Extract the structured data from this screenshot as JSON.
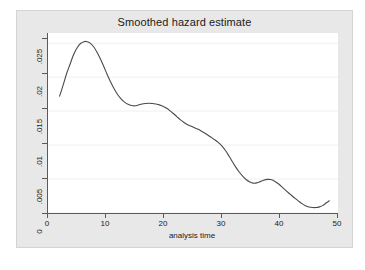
{
  "chart_data": {
    "type": "line",
    "title": "Smoothed hazard estimate",
    "xlabel": "analysis time",
    "ylabel": "",
    "xlim": [
      0,
      50
    ],
    "ylim": [
      0,
      0.0265
    ],
    "grid": "horizontal",
    "legend": "none",
    "xticks": [
      "0",
      "10",
      "20",
      "30",
      "40",
      "50"
    ],
    "xtick_values": [
      0,
      10,
      20,
      30,
      40,
      50
    ],
    "yticks": [
      "0",
      ".005",
      ".01",
      ".015",
      ".02",
      ".025"
    ],
    "ytick_values": [
      0,
      0.005,
      0.01,
      0.015,
      0.02,
      0.025
    ],
    "line_color": "#4a4a4a",
    "series": [
      {
        "name": "smoothed hazard",
        "x": [
          2.0,
          2.6,
          3.2,
          3.8,
          4.4,
          5.0,
          5.6,
          6.2,
          6.6,
          7.2,
          7.8,
          8.4,
          9.0,
          9.6,
          10.2,
          10.8,
          11.4,
          12.0,
          12.6,
          13.2,
          13.8,
          14.4,
          15.0,
          15.6,
          16.2,
          16.8,
          17.4,
          18.0,
          18.6,
          19.2,
          19.8,
          20.4,
          21.0,
          21.6,
          22.2,
          22.8,
          23.4,
          24.0,
          24.6,
          25.2,
          25.8,
          26.4,
          27.0,
          27.6,
          28.2,
          28.8,
          29.4,
          30.0,
          30.6,
          31.2,
          31.8,
          32.4,
          33.0,
          33.6,
          34.2,
          34.8,
          35.4,
          36.0,
          36.6,
          37.2,
          37.8,
          38.4,
          39.0,
          39.6,
          40.2,
          40.8,
          41.4,
          42.0,
          42.6,
          43.2,
          43.8,
          44.4,
          45.0,
          45.6,
          46.2,
          46.8,
          47.4,
          48.0,
          48.5
        ],
        "y": [
          0.0172,
          0.0188,
          0.0205,
          0.0219,
          0.0233,
          0.0243,
          0.02495,
          0.02522,
          0.02525,
          0.02505,
          0.02455,
          0.02375,
          0.02275,
          0.0216,
          0.0204,
          0.0193,
          0.0183,
          0.01745,
          0.0168,
          0.01632,
          0.016,
          0.01582,
          0.01578,
          0.0159,
          0.01605,
          0.01613,
          0.01615,
          0.01613,
          0.01605,
          0.01592,
          0.01572,
          0.01545,
          0.01508,
          0.01465,
          0.0142,
          0.01375,
          0.01335,
          0.01303,
          0.0128,
          0.01258,
          0.01235,
          0.01208,
          0.01178,
          0.01145,
          0.0111,
          0.01075,
          0.01035,
          0.00985,
          0.0092,
          0.0084,
          0.00755,
          0.00672,
          0.006,
          0.0054,
          0.0049,
          0.00458,
          0.0044,
          0.00443,
          0.00462,
          0.00483,
          0.00495,
          0.00492,
          0.00472,
          0.00438,
          0.00395,
          0.00348,
          0.00302,
          0.00258,
          0.00215,
          0.00175,
          0.00138,
          0.00108,
          0.00088,
          0.0008,
          0.0008,
          0.0009,
          0.00112,
          0.0015,
          0.0018
        ]
      }
    ],
    "annotations": {
      "peak_value": 0.02525,
      "peak_time": 6.6,
      "start_value": 0.0172,
      "start_time": 2.0,
      "end_value": 0.0018,
      "end_time": 48.5
    }
  }
}
